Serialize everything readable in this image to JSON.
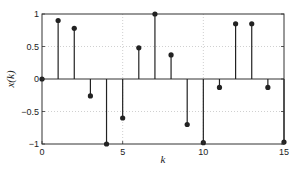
{
  "chart_data": {
    "type": "stem",
    "title": "",
    "xlabel": "k",
    "ylabel": "x(k)",
    "xlim": [
      0,
      15
    ],
    "ylim": [
      -1,
      1
    ],
    "grid": true,
    "x": [
      0,
      1,
      2,
      3,
      4,
      5,
      6,
      7,
      8,
      9,
      10,
      11,
      12,
      13,
      14,
      15
    ],
    "values": [
      0,
      0.9,
      0.78,
      -0.26,
      -1.0,
      -0.6,
      0.48,
      1.0,
      0.37,
      -0.7,
      -0.98,
      -0.13,
      0.85,
      0.85,
      -0.13,
      -0.97
    ],
    "xticks": [
      0,
      5,
      10,
      15
    ],
    "xtick_labels": [
      "0",
      "5",
      "10",
      "15"
    ],
    "yticks": [
      -1,
      -0.5,
      0,
      0.5,
      1
    ],
    "ytick_labels": [
      "−1",
      "−0.5",
      "0",
      "0.5",
      "1"
    ],
    "colors": {
      "stem": "#222222",
      "grid": "#bbbbbb",
      "axes": "#333333"
    }
  }
}
